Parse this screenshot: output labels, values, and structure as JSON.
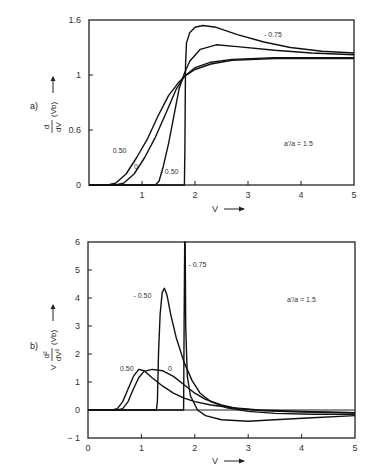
{
  "chart_data": [
    {
      "type": "line",
      "panel_label": "a)",
      "ylabel_parts": {
        "prefix": "",
        "num": "d",
        "den": "dV",
        "paren": "(Vb)",
        "arrow": "→"
      },
      "xlabel": "V",
      "xlabel_arrow": "→",
      "xlim": [
        0,
        5
      ],
      "x_ticks": [
        1,
        2,
        3,
        4,
        5
      ],
      "y_tick_labels": [
        "0",
        "0.6",
        "1",
        "1.6"
      ],
      "y_tick_note": "tick labels drawn at equal spacing in the original figure",
      "annotation": "a'/a = 1.5",
      "grid": false,
      "series": [
        {
          "name": "0.50",
          "points": [
            [
              0,
              0
            ],
            [
              0.35,
              0
            ],
            [
              0.5,
              0.02
            ],
            [
              0.7,
              0.12
            ],
            [
              0.9,
              0.3
            ],
            [
              1.1,
              0.5
            ],
            [
              1.3,
              0.7
            ],
            [
              1.5,
              0.85
            ],
            [
              1.7,
              0.95
            ],
            [
              1.8,
              0.99
            ],
            [
              2.0,
              1.06
            ],
            [
              2.3,
              1.12
            ],
            [
              2.7,
              1.16
            ],
            [
              3.5,
              1.18
            ],
            [
              5,
              1.18
            ]
          ]
        },
        {
          "name": "0",
          "points": [
            [
              0,
              0
            ],
            [
              0.5,
              0
            ],
            [
              0.65,
              0.02
            ],
            [
              0.85,
              0.12
            ],
            [
              1.05,
              0.3
            ],
            [
              1.25,
              0.52
            ],
            [
              1.45,
              0.72
            ],
            [
              1.65,
              0.9
            ],
            [
              1.8,
              0.99
            ],
            [
              2.0,
              1.08
            ],
            [
              2.3,
              1.14
            ],
            [
              2.7,
              1.17
            ],
            [
              3.5,
              1.19
            ],
            [
              5,
              1.19
            ]
          ]
        },
        {
          "name": "-0.50",
          "points": [
            [
              0,
              0
            ],
            [
              1.25,
              0
            ],
            [
              1.32,
              0.04
            ],
            [
              1.4,
              0.2
            ],
            [
              1.5,
              0.45
            ],
            [
              1.6,
              0.7
            ],
            [
              1.7,
              0.9
            ],
            [
              1.8,
              1.02
            ],
            [
              1.9,
              1.15
            ],
            [
              2.1,
              1.28
            ],
            [
              2.4,
              1.33
            ],
            [
              2.8,
              1.31
            ],
            [
              3.5,
              1.27
            ],
            [
              4.2,
              1.24
            ],
            [
              5,
              1.22
            ]
          ]
        },
        {
          "name": "-0.75",
          "points": [
            [
              0,
              0
            ],
            [
              1.8,
              0
            ],
            [
              1.81,
              0.4
            ],
            [
              1.82,
              1.1
            ],
            [
              1.84,
              1.35
            ],
            [
              1.9,
              1.46
            ],
            [
              2.0,
              1.52
            ],
            [
              2.15,
              1.54
            ],
            [
              2.4,
              1.52
            ],
            [
              2.8,
              1.44
            ],
            [
              3.3,
              1.36
            ],
            [
              3.8,
              1.3
            ],
            [
              4.4,
              1.26
            ],
            [
              5,
              1.24
            ]
          ]
        }
      ],
      "labels": [
        {
          "text": "0.50",
          "x": 0.45,
          "y": 0.35
        },
        {
          "text": "0",
          "x": 0.85,
          "y": 0.17
        },
        {
          "text": "- 0.50",
          "x": 1.35,
          "y": 0.12
        },
        {
          "text": "- 0.75",
          "x": 3.3,
          "y": 1.42
        }
      ]
    },
    {
      "type": "line",
      "panel_label": "b)",
      "ylabel_parts": {
        "prefix": "V",
        "num": "d²",
        "den": "dV²",
        "paren": "(Vb)",
        "arrow": "→"
      },
      "xlabel": "V",
      "xlabel_arrow": "→",
      "xlim": [
        0,
        5
      ],
      "ylim": [
        -1,
        6
      ],
      "x_ticks": [
        0,
        1,
        2,
        3,
        4,
        5
      ],
      "y_ticks": [
        -1,
        0,
        1,
        2,
        3,
        4,
        5,
        6
      ],
      "annotation": "a'/a = 1.5",
      "grid": false,
      "series": [
        {
          "name": "0.50",
          "points": [
            [
              0,
              0
            ],
            [
              0.45,
              0
            ],
            [
              0.55,
              0.05
            ],
            [
              0.65,
              0.3
            ],
            [
              0.75,
              0.75
            ],
            [
              0.85,
              1.2
            ],
            [
              0.95,
              1.45
            ],
            [
              1.05,
              1.4
            ],
            [
              1.2,
              1.15
            ],
            [
              1.4,
              0.85
            ],
            [
              1.6,
              0.6
            ],
            [
              1.8,
              0.42
            ],
            [
              2.0,
              0.3
            ],
            [
              2.3,
              0.18
            ],
            [
              2.7,
              0.08
            ],
            [
              3.2,
              0.0
            ],
            [
              4,
              -0.05
            ],
            [
              5,
              -0.1
            ]
          ]
        },
        {
          "name": "0",
          "points": [
            [
              0,
              0
            ],
            [
              0.55,
              0
            ],
            [
              0.65,
              0.05
            ],
            [
              0.75,
              0.3
            ],
            [
              0.85,
              0.75
            ],
            [
              0.95,
              1.15
            ],
            [
              1.05,
              1.38
            ],
            [
              1.2,
              1.45
            ],
            [
              1.4,
              1.4
            ],
            [
              1.6,
              1.2
            ],
            [
              1.8,
              0.9
            ],
            [
              2.0,
              0.6
            ],
            [
              2.2,
              0.38
            ],
            [
              2.5,
              0.18
            ],
            [
              2.8,
              0.05
            ],
            [
              3.3,
              -0.03
            ],
            [
              4,
              -0.07
            ],
            [
              5,
              -0.1
            ]
          ]
        },
        {
          "name": "-0.50",
          "points": [
            [
              0,
              0
            ],
            [
              1.28,
              0
            ],
            [
              1.3,
              0.3
            ],
            [
              1.32,
              2.0
            ],
            [
              1.35,
              3.4
            ],
            [
              1.39,
              4.2
            ],
            [
              1.43,
              4.35
            ],
            [
              1.48,
              4.1
            ],
            [
              1.55,
              3.4
            ],
            [
              1.65,
              2.6
            ],
            [
              1.8,
              1.7
            ],
            [
              1.95,
              1.05
            ],
            [
              2.1,
              0.6
            ],
            [
              2.3,
              0.3
            ],
            [
              2.6,
              0.08
            ],
            [
              3.0,
              -0.05
            ],
            [
              3.5,
              -0.12
            ],
            [
              4.2,
              -0.15
            ],
            [
              5,
              -0.15
            ]
          ]
        },
        {
          "name": "-0.75",
          "points": [
            [
              0,
              0
            ],
            [
              1.79,
              0
            ],
            [
              1.8,
              3.0
            ],
            [
              1.81,
              6.0
            ],
            [
              1.82,
              6.0
            ],
            [
              1.83,
              3.0
            ],
            [
              1.86,
              1.2
            ],
            [
              1.92,
              0.5
            ],
            [
              2.05,
              0.0
            ],
            [
              2.2,
              -0.2
            ],
            [
              2.5,
              -0.35
            ],
            [
              3.0,
              -0.4
            ],
            [
              3.5,
              -0.35
            ],
            [
              4.2,
              -0.28
            ],
            [
              5,
              -0.2
            ]
          ]
        }
      ],
      "labels": [
        {
          "text": "0.50",
          "x": 0.6,
          "y": 1.4
        },
        {
          "text": "0",
          "x": 1.5,
          "y": 1.4
        },
        {
          "text": "- 0.50",
          "x": 0.85,
          "y": 4.0
        },
        {
          "text": "- 0.75",
          "x": 1.88,
          "y": 5.1
        }
      ]
    }
  ]
}
